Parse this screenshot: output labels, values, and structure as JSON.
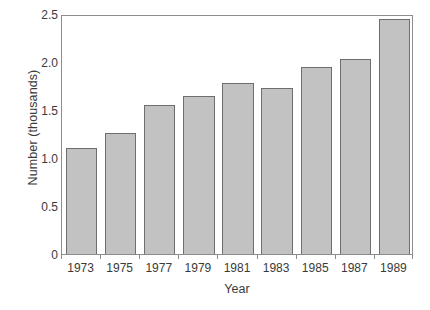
{
  "chart_data": {
    "type": "bar",
    "title": "",
    "subtitle": "",
    "xlabel": "Year",
    "ylabel": "Number (thousands)",
    "categories": [
      "1973",
      "1975",
      "1977",
      "1979",
      "1981",
      "1983",
      "1985",
      "1987",
      "1989"
    ],
    "values": [
      1.1,
      1.26,
      1.55,
      1.65,
      1.78,
      1.73,
      1.95,
      2.03,
      2.45
    ],
    "series": [
      {
        "name": "Number (thousands)",
        "values": [
          1.1,
          1.26,
          1.55,
          1.65,
          1.78,
          1.73,
          1.95,
          2.03,
          2.45
        ]
      }
    ],
    "ylim": [
      0,
      2.5
    ],
    "yticks": [
      0,
      0.5,
      1.0,
      1.5,
      2.0,
      2.5
    ],
    "ytick_labels": [
      "0",
      "0.5",
      "1.0",
      "1.5",
      "2.0",
      "2.5"
    ],
    "xtick_labels": [
      "1973",
      "1975",
      "1977",
      "1979",
      "1981",
      "1983",
      "1985",
      "1987",
      "1989"
    ],
    "grid": false,
    "legend": false,
    "legend_position": "none",
    "annotations": [],
    "colors": {
      "bar_fill": "#c2c2c2",
      "bar_stroke": "#6e6e6e",
      "axis": "#8c8c8c",
      "text": "#3a3a3a",
      "background": "#ffffff"
    }
  }
}
